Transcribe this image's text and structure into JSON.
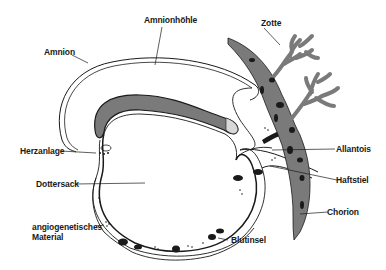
{
  "diagram": {
    "type": "anatomical-diagram",
    "colors": {
      "tissue_fill": "#7a7a7a",
      "outline": "#1a1a1a",
      "background": "#ffffff",
      "blood_island": "#1a1a1a"
    },
    "labels": {
      "amnionhoehle": "Amnionhöhle",
      "amnion": "Amnion",
      "zotte": "Zotte",
      "herzanlage": "Herzanlage",
      "allantois": "Allantois",
      "dottersack": "Dottersack",
      "haftstiel": "Haftstiel",
      "chorion": "Chorion",
      "angiogenetisches_1": "angiogenetisches",
      "angiogenetisches_2": "Material",
      "blutinsel": "Blutinsel"
    }
  }
}
